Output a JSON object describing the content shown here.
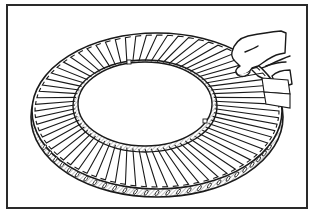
{
  "figure": {
    "style": "black line-art illustration",
    "colors": {
      "ink": "#1a1a1a",
      "hatch": "#9a9a9a",
      "background": "#ffffff",
      "frame": "#2a2a2a"
    },
    "ring": {
      "cx": 157,
      "cy": 112,
      "outer_rx": 125,
      "outer_ry": 80,
      "inner_rx": 68,
      "inner_ry": 43,
      "vane_count": 72
    }
  }
}
